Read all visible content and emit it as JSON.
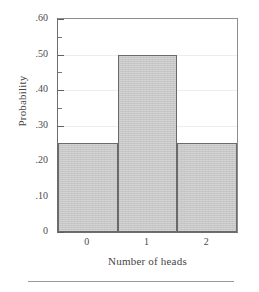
{
  "chart_data": {
    "type": "bar",
    "title": "",
    "categories": [
      "0",
      "1",
      "2"
    ],
    "values": [
      0.25,
      0.5,
      0.25
    ],
    "xlabel": "Number of heads",
    "ylabel": "Probability",
    "ylim": [
      0,
      0.6
    ],
    "xlim": [
      -0.5,
      2.5
    ],
    "grid": true,
    "legend": null,
    "y_major_ticks": [
      {
        "value": 0.6,
        "label": ".60"
      },
      {
        "value": 0.5,
        "label": ".50"
      },
      {
        "value": 0.4,
        "label": ".40"
      },
      {
        "value": 0.3,
        "label": ".30"
      },
      {
        "value": 0.2,
        "label": ".20"
      },
      {
        "value": 0.1,
        "label": ".10"
      },
      {
        "value": 0.0,
        "label": "0"
      }
    ],
    "y_minor_ticks": [
      0.55,
      0.45,
      0.35,
      0.25,
      0.15,
      0.05
    ],
    "bar_fill_color": "#c6c7c6",
    "bar_edge_color": "#6a6a6a",
    "axis_color": "#6e6e6e",
    "gridline_color": "#ededed",
    "bar_width_fraction": 1.0
  },
  "figure": {
    "ylabel_text": "Probability",
    "xlabel_text": "Number of heads",
    "ytick_labels": [
      ".60",
      ".50",
      ".40",
      ".30",
      ".20",
      ".10",
      "0"
    ],
    "xtick_labels": [
      "0",
      "1",
      "2"
    ]
  }
}
